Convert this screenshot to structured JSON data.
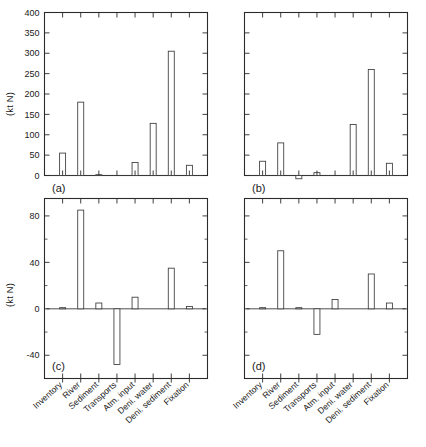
{
  "figure": {
    "ylabel_top": "(kt N)",
    "ylabel_bottom": "(kt N)",
    "panel_labels": [
      "(a)",
      "(b)",
      "(c)",
      "(d)"
    ],
    "categories": [
      "Inventory",
      "River",
      "Sediment",
      "Transports",
      "Atm. input",
      "Deni. water",
      "Deni. sediment",
      "Fixation"
    ],
    "top_ticks": [
      "0",
      "50",
      "100",
      "150",
      "200",
      "250",
      "300",
      "350",
      "400"
    ],
    "bottom_ticks": [
      "-40",
      "0",
      "40",
      "80"
    ]
  },
  "chart_data": [
    {
      "type": "bar",
      "title": "(a)",
      "categories": [
        "Inventory",
        "River",
        "Sediment",
        "Transports",
        "Atm. input",
        "Deni. water",
        "Deni. sediment",
        "Fixation"
      ],
      "values": [
        55,
        180,
        2,
        0,
        32,
        128,
        305,
        25
      ],
      "xlabel": "",
      "ylabel": "(kt N)",
      "ylim": [
        0,
        400
      ],
      "ytick_step": 50,
      "grid": false,
      "legend": "none"
    },
    {
      "type": "bar",
      "title": "(b)",
      "categories": [
        "Inventory",
        "River",
        "Sediment",
        "Transports",
        "Atm. input",
        "Deni. water",
        "Deni. sediment",
        "Fixation"
      ],
      "values": [
        35,
        80,
        -8,
        7,
        0,
        125,
        260,
        30
      ],
      "xlabel": "",
      "ylabel": "(kt N)",
      "ylim": [
        0,
        400
      ],
      "ytick_step": 50,
      "grid": false,
      "legend": "none"
    },
    {
      "type": "bar",
      "title": "(c)",
      "categories": [
        "Inventory",
        "River",
        "Sediment",
        "Transports",
        "Atm. input",
        "Deni. water",
        "Deni. sediment",
        "Fixation"
      ],
      "values": [
        1,
        85,
        5,
        -48,
        10,
        0,
        35,
        2
      ],
      "xlabel": "",
      "ylabel": "(kt N)",
      "ylim": [
        -60,
        95
      ],
      "ytick_step": 40,
      "grid": false,
      "legend": "none"
    },
    {
      "type": "bar",
      "title": "(d)",
      "categories": [
        "Inventory",
        "River",
        "Sediment",
        "Transports",
        "Atm. input",
        "Deni. water",
        "Deni. sediment",
        "Fixation"
      ],
      "values": [
        1,
        50,
        1,
        -22,
        8,
        0,
        30,
        5
      ],
      "xlabel": "",
      "ylabel": "(kt N)",
      "ylim": [
        -60,
        95
      ],
      "ytick_step": 40,
      "grid": false,
      "legend": "none"
    }
  ]
}
